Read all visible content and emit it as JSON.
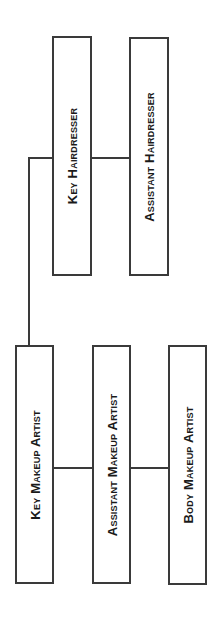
{
  "diagram": {
    "type": "org-chart",
    "nodes": [
      {
        "id": "key_hairdresser",
        "label": "Key Hairdresser"
      },
      {
        "id": "assistant_hairdresser",
        "label": "Assistant Hairdresser"
      },
      {
        "id": "key_makeup_artist",
        "label": "Key Makeup Artist"
      },
      {
        "id": "assistant_makeup_artist",
        "label": "Assistant Makeup Artist"
      },
      {
        "id": "body_makeup_artist",
        "label": "Body Makeup Artist"
      }
    ],
    "edges": [
      [
        "key_makeup_artist",
        "key_hairdresser"
      ],
      [
        "key_hairdresser",
        "assistant_hairdresser"
      ],
      [
        "key_makeup_artist",
        "assistant_makeup_artist"
      ],
      [
        "assistant_makeup_artist",
        "body_makeup_artist"
      ]
    ],
    "colors": {
      "stroke": "#3a3a3a",
      "text": "#1a1a1a",
      "background": "#ffffff"
    }
  }
}
